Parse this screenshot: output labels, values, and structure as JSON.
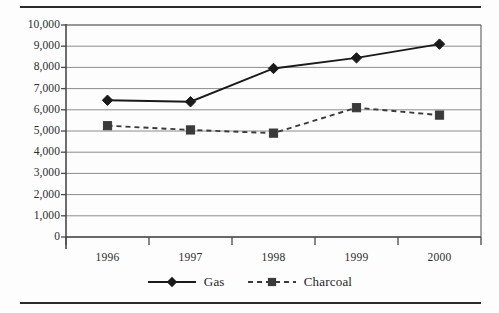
{
  "chart_data": {
    "type": "line",
    "title": "",
    "subtitle": "",
    "xlabel": "",
    "ylabel": "",
    "categories": [
      "1996",
      "1997",
      "1998",
      "1999",
      "2000"
    ],
    "series": [
      {
        "name": "Gas",
        "values": [
          6450,
          6380,
          7950,
          8450,
          9100
        ],
        "marker": "diamond",
        "linestyle": "solid",
        "color": "#1a1a1a"
      },
      {
        "name": "Charcoal",
        "values": [
          5250,
          5050,
          4900,
          6100,
          5750
        ],
        "marker": "square",
        "linestyle": "dashed",
        "color": "#3a3a3a"
      }
    ],
    "ylim": [
      0,
      10000
    ],
    "ytick_values": [
      0,
      1000,
      2000,
      3000,
      4000,
      5000,
      6000,
      7000,
      8000,
      9000,
      10000
    ],
    "ytick_labels": [
      "0",
      "1,000",
      "2,000",
      "3,000",
      "4,000",
      "5,000",
      "6,000",
      "7,000",
      "8,000",
      "9,000",
      "10,000"
    ],
    "grid": true,
    "grid_axis": "y",
    "grid_color": "#8c8c8c",
    "legend": [
      "Gas",
      "Charcoal"
    ],
    "legend_position": "bottom",
    "axis_color": "#4a4a4a",
    "background_color": "#fdfdfd"
  },
  "figure": {
    "top_rule": "",
    "bottom_rule": ""
  }
}
